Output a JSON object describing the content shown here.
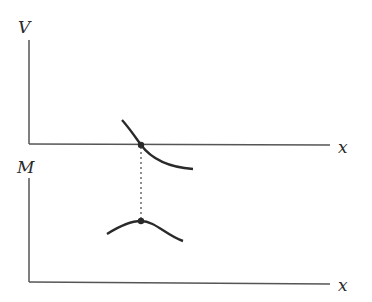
{
  "diagram": {
    "top_plot": {
      "y_label": "V",
      "x_label": "x",
      "curve": "decreasing curve crossing the x-axis",
      "marked_point": "zero crossing of V"
    },
    "bottom_plot": {
      "y_label": "M",
      "x_label": "x",
      "curve": "arch with a maximum",
      "marked_point": "maximum of M"
    },
    "connector": "dotted vertical line linking V zero crossing to M maximum",
    "colors": {
      "ink": "#2a2a2a",
      "axis": "#555555",
      "background": "#ffffff"
    }
  }
}
